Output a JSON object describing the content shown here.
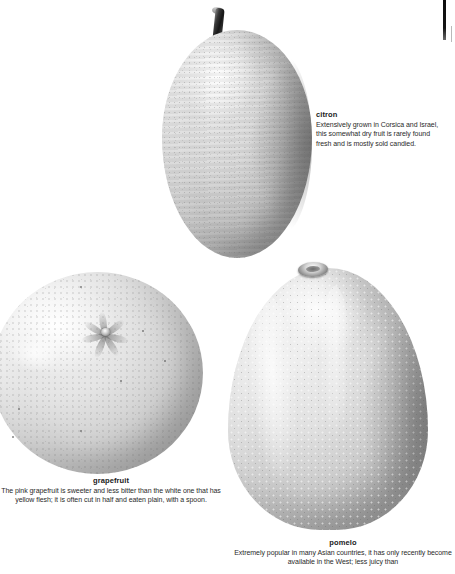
{
  "page": {
    "background_color": "#ffffff",
    "text_color": "#231f20"
  },
  "figures": [
    {
      "id": "citron",
      "label": "citron",
      "icon": "citron-fruit-illustration"
    },
    {
      "id": "grapefruit",
      "label": "grapefruit",
      "icon": "grapefruit-fruit-illustration"
    },
    {
      "id": "pomelo",
      "label": "pomelo",
      "icon": "pomelo-fruit-illustration"
    }
  ],
  "captions": {
    "citron": {
      "title": "citron",
      "text": "Extensively grown in Corsica and Israel, this somewhat dry fruit is rarely found fresh and is mostly sold candied."
    },
    "grapefruit": {
      "title": "grapefruit",
      "text": "The pink grapefruit is sweeter and less bitter than the white one that has yellow flesh; it is often cut in half and eaten plain, with a spoon."
    },
    "pomelo": {
      "title": "pomelo",
      "text": "Extremely popular in many Asian countries, it has only recently become available in the West; less juicy than"
    }
  }
}
